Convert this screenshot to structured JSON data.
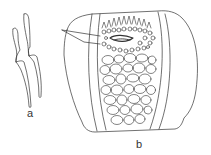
{
  "figure": {
    "type": "scientific line drawing",
    "line_color": "#333333",
    "background": "#ffffff",
    "panels": [
      {
        "id": "a",
        "label": "a",
        "description": "two elongated curved spicule-like elements with a lateral notch"
      },
      {
        "id": "b",
        "label": "b",
        "description": "section showing an outer wall, two paired inner band lines, a dense cluster of small cells at top with a pointer line, and many rounded oval cells filling the center"
      }
    ]
  }
}
